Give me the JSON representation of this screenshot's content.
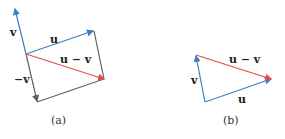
{
  "colors": {
    "blue": "#3a7fc7",
    "red": "#e0504a",
    "gray": "#606060"
  },
  "panel_a": {
    "caption": "(a)",
    "labels": {
      "v": "v",
      "u": "u",
      "u_minus_v": "u − v",
      "neg_v": "−v"
    }
  },
  "panel_b": {
    "caption": "(b)",
    "labels": {
      "v": "v",
      "u": "u",
      "u_minus_v": "u − v"
    }
  }
}
